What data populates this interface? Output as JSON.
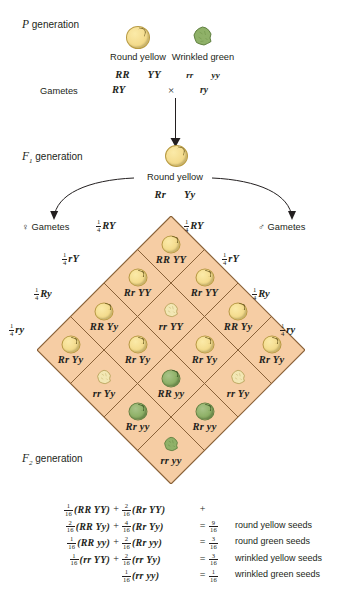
{
  "generations": {
    "p_label": "P generation",
    "f1_label": "F₁ generation",
    "f2_label": "F₂ generation",
    "p_sub": "",
    "f1_sub": "1",
    "f2_sub": "2"
  },
  "parents": {
    "gametes_row_label": "Gametes",
    "cross_symbol": "×",
    "left": {
      "phenotype": "Round yellow",
      "genotype_1": "RR",
      "genotype_2": "YY",
      "gamete": "RY",
      "seed_shape": "round",
      "seed_color": "yellow"
    },
    "right": {
      "phenotype": "Wrinkled green",
      "genotype_1": "rr",
      "genotype_2": "yy",
      "gamete": "ry",
      "seed_shape": "wrinkled",
      "seed_color": "green"
    }
  },
  "f1": {
    "phenotype": "Round yellow",
    "genotype_1": "Rr",
    "genotype_2": "Yy",
    "seed_shape": "round",
    "seed_color": "yellow",
    "female_gametes_label": "Gametes",
    "male_gametes_label": "Gametes",
    "female_symbol": "♀",
    "male_symbol": "♂"
  },
  "gametes": {
    "fraction_num": "1",
    "fraction_den": "4",
    "top_left": "RY",
    "top_right": "RY",
    "left_side": [
      "rY",
      "Ry",
      "ry"
    ],
    "right_side": [
      "rY",
      "Ry",
      "ry"
    ]
  },
  "punnett": {
    "fill_color": "#f6cda4",
    "line_color": "#8a6239",
    "rows": [
      [
        {
          "genotype_1": "RR",
          "genotype_2": "YY",
          "shape": "round",
          "color": "yellow"
        },
        {
          "genotype_1": "Rr",
          "genotype_2": "YY",
          "shape": "round",
          "color": "yellow"
        },
        {
          "genotype_1": "RR",
          "genotype_2": "Yy",
          "shape": "round",
          "color": "yellow"
        },
        {
          "genotype_1": "Rr",
          "genotype_2": "Yy",
          "shape": "round",
          "color": "yellow"
        }
      ],
      [
        {
          "genotype_1": "Rr",
          "genotype_2": "YY",
          "shape": "round",
          "color": "yellow"
        },
        {
          "genotype_1": "rr",
          "genotype_2": "YY",
          "shape": "wrinkled",
          "color": "yellow"
        },
        {
          "genotype_1": "Rr",
          "genotype_2": "Yy",
          "shape": "round",
          "color": "yellow"
        },
        {
          "genotype_1": "rr",
          "genotype_2": "Yy",
          "shape": "wrinkled",
          "color": "yellow"
        }
      ],
      [
        {
          "genotype_1": "RR",
          "genotype_2": "Yy",
          "shape": "round",
          "color": "yellow"
        },
        {
          "genotype_1": "Rr",
          "genotype_2": "Yy",
          "shape": "round",
          "color": "yellow"
        },
        {
          "genotype_1": "RR",
          "genotype_2": "yy",
          "shape": "round",
          "color": "green"
        },
        {
          "genotype_1": "Rr",
          "genotype_2": "yy",
          "shape": "round",
          "color": "green"
        }
      ],
      [
        {
          "genotype_1": "Rr",
          "genotype_2": "Yy",
          "shape": "round",
          "color": "yellow"
        },
        {
          "genotype_1": "rr",
          "genotype_2": "Yy",
          "shape": "wrinkled",
          "color": "yellow"
        },
        {
          "genotype_1": "Rr",
          "genotype_2": "yy",
          "shape": "round",
          "color": "green"
        },
        {
          "genotype_1": "rr",
          "genotype_2": "yy",
          "shape": "wrinkled",
          "color": "green"
        }
      ]
    ]
  },
  "summary": {
    "rows": [
      {
        "n1": "1",
        "d1": "16",
        "g1": "RR YY",
        "op": "+",
        "n2": "2",
        "d2": "16",
        "g2": "Rr YY",
        "eq": "",
        "n3": "",
        "d3": "",
        "result": "",
        "trailing_plus": "+"
      },
      {
        "n1": "2",
        "d1": "16",
        "g1": "RR Yy",
        "op": "+",
        "n2": "4",
        "d2": "16",
        "g2": "Rr Yy",
        "eq": "=",
        "n3": "9",
        "d3": "16",
        "result": "round yellow seeds",
        "trailing_plus": ""
      },
      {
        "n1": "1",
        "d1": "16",
        "g1": "RR yy",
        "op": "+",
        "n2": "2",
        "d2": "16",
        "g2": "Rr yy",
        "eq": "=",
        "n3": "3",
        "d3": "16",
        "result": "round green seeds",
        "trailing_plus": ""
      },
      {
        "n1": "1",
        "d1": "16",
        "g1": "rr YY",
        "op": "+",
        "n2": "2",
        "d2": "16",
        "g2": "rr Yy",
        "eq": "=",
        "n3": "3",
        "d3": "16",
        "result": "wrinkled yellow seeds",
        "trailing_plus": ""
      },
      {
        "n1": "",
        "d1": "",
        "g1": "",
        "op": "",
        "n2": "1",
        "d2": "16",
        "g2": "rr yy",
        "eq": "=",
        "n3": "1",
        "d3": "16",
        "result": "wrinkled green seeds",
        "trailing_plus": ""
      }
    ]
  }
}
